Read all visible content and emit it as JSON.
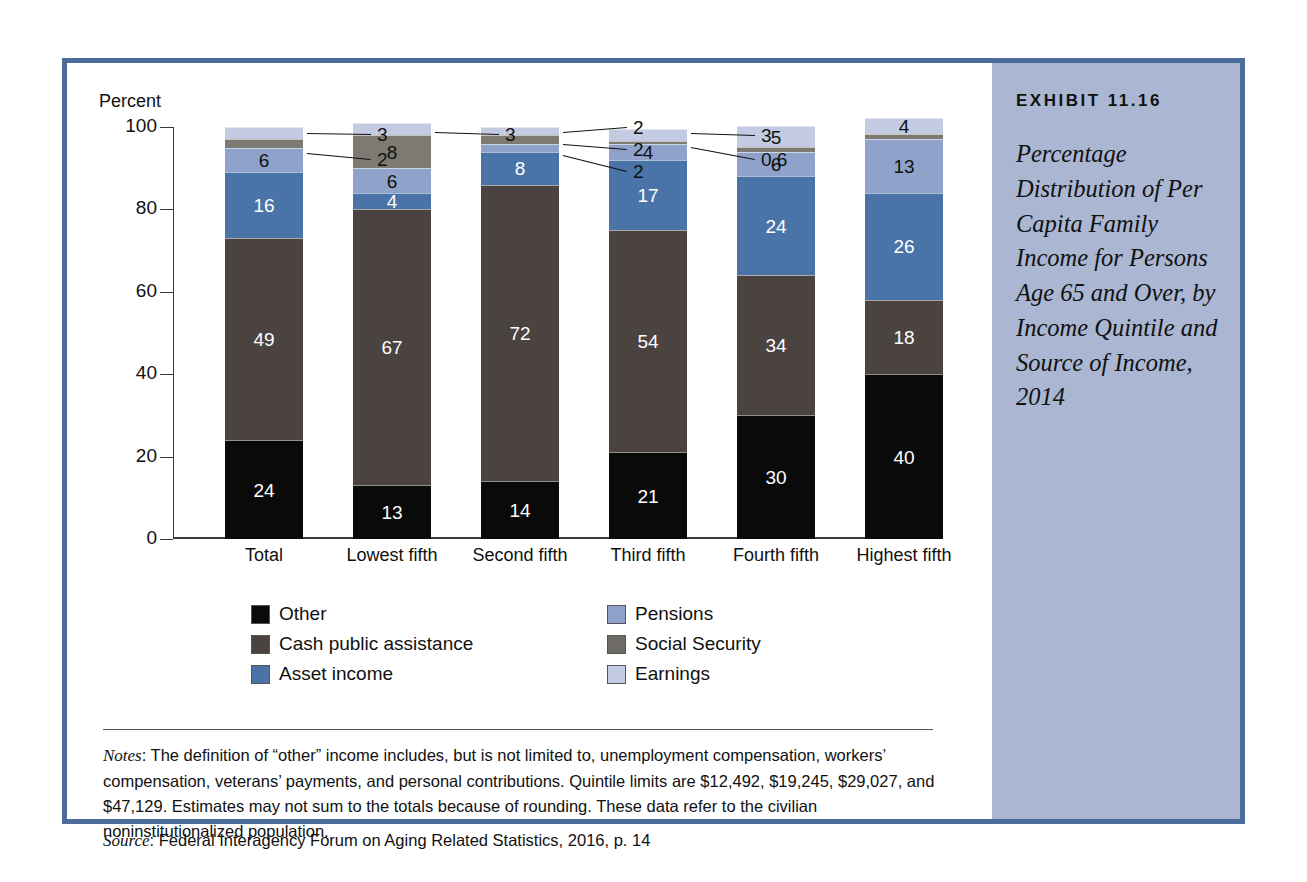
{
  "exhibit": {
    "label": "EXHIBIT 11.16",
    "title": "Percentage Distribution of Per Capita Family Income for Persons Age 65 and Over, by Income Quintile and Source of Income, 2014",
    "panel_color": "#aab6d2",
    "border_color": "#4c6c9c"
  },
  "notes": {
    "notes_label": "Notes",
    "notes_text": ": The definition of “other” income includes, but is not limited to, unemployment compensation, workers’ compensation, veterans’ payments, and personal contributions. Quintile limits are $12,492, $19,245, $29,027, and $47,129. Estimates may not sum to the totals because of rounding. These data refer to the civilian noninstitutionalized population.",
    "source_label": "Source",
    "source_text": ": Federal Interagency Forum on Aging Related Statistics, 2016, p. 14"
  },
  "chart_data": {
    "type": "bar",
    "stacked": true,
    "title": "Percentage Distribution of Per Capita Family Income for Persons Age 65 and Over, by Income Quintile and Source of Income, 2014",
    "xlabel": "",
    "ylabel": "Percent",
    "ylim": [
      0,
      100
    ],
    "yticks": [
      0,
      20,
      40,
      60,
      80,
      100
    ],
    "grid": false,
    "legend_position": "below",
    "categories": [
      "Total",
      "Lowest fifth",
      "Second fifth",
      "Third fifth",
      "Fourth fifth",
      "Highest fifth"
    ],
    "series": [
      {
        "name": "Other",
        "color": "#0a0a0a",
        "values": [
          24,
          13,
          14,
          21,
          30,
          40
        ]
      },
      {
        "name": "Social Security",
        "color": "#4a4340",
        "values": [
          49,
          67,
          72,
          54,
          34,
          18
        ]
      },
      {
        "name": "Asset income",
        "color": "#4a73a8",
        "values": [
          16,
          4,
          8,
          17,
          24,
          26
        ]
      },
      {
        "name": "Pensions",
        "color": "#8fa2c9",
        "values": [
          6,
          6,
          2,
          4,
          6,
          13
        ]
      },
      {
        "name": "Cash public assistance",
        "color": "#7d7a72",
        "values": [
          2,
          8,
          2,
          0.6,
          1.2,
          1.2
        ]
      },
      {
        "name": "Earnings",
        "color": "#c2cbe2",
        "values": [
          3,
          3,
          2,
          3,
          5,
          4
        ]
      }
    ],
    "bar_labels": {
      "Total": {
        "inside": [
          "24",
          "49",
          "16",
          "6"
        ],
        "callouts": [
          "2",
          "3"
        ]
      },
      "Lowest fifth": {
        "inside": [
          "13",
          "67",
          "4",
          "6",
          "8"
        ],
        "callouts": [
          "3"
        ]
      },
      "Second fifth": {
        "inside": [
          "14",
          "72",
          "8"
        ],
        "callouts": [
          "2",
          "2",
          "2"
        ]
      },
      "Third fifth": {
        "inside": [
          "21",
          "54",
          "17",
          "4"
        ],
        "callouts": [
          "0.6",
          "3"
        ]
      },
      "Fourth fifth": {
        "inside": [
          "30",
          "34",
          "24",
          "6",
          "5"
        ],
        "callouts": []
      },
      "Highest fifth": {
        "inside": [
          "40",
          "18",
          "26",
          "13",
          "4"
        ],
        "callouts": []
      }
    },
    "legend_entries": [
      {
        "label": "Other",
        "color": "#0a0a0a"
      },
      {
        "label": "Cash public assistance",
        "color": "#4a4340"
      },
      {
        "label": "Asset income",
        "color": "#4a73a8"
      },
      {
        "label": "Pensions",
        "color": "#8fa2c9"
      },
      {
        "label": "Social Security",
        "color": "#6e6b66"
      },
      {
        "label": "Earnings",
        "color": "#c2cbe2"
      }
    ]
  }
}
